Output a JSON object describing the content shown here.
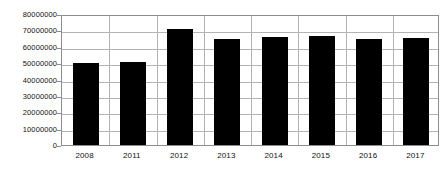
{
  "chart_data": {
    "type": "bar",
    "title": "",
    "subtitle": "",
    "xlabel": "",
    "ylabel": "",
    "categories": [
      "2008",
      "2011",
      "2012",
      "2013",
      "2014",
      "2015",
      "2016",
      "2017"
    ],
    "values": [
      50000000,
      50500000,
      71000000,
      64500000,
      65800000,
      66800000,
      64500000,
      65200000
    ],
    "ylim": [
      0,
      80000000
    ],
    "ytick_labels": [
      "80000000",
      "70000000",
      "60000000",
      "50000000",
      "40000000",
      "30000000",
      "20000000",
      "10000000",
      "0"
    ],
    "ytick_values": [
      80000000,
      70000000,
      60000000,
      50000000,
      40000000,
      30000000,
      20000000,
      10000000,
      0
    ],
    "grid": {
      "horizontal": true,
      "vertical": true
    },
    "legend": {
      "visible": false,
      "entries": []
    },
    "annotations": [],
    "bar_color": "#000000",
    "grid_color": "#b3b3b3",
    "frame_color": "#8d8d8d",
    "background_color": "#ffffff",
    "bar_width_ratio": 0.55
  }
}
